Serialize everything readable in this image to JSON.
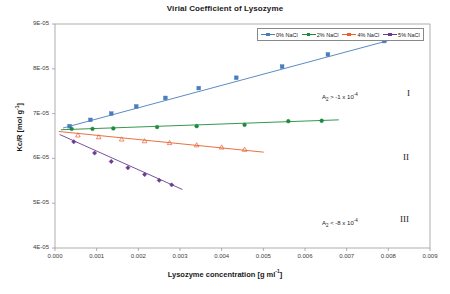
{
  "chart_data": {
    "type": "scatter",
    "title": "Virial Coefficient of Lysozyme",
    "xlabel": "Lysozyme concentration [g ml-1]",
    "xlabel_parts": {
      "text": "Lysozyme concentration [g ml",
      "sup": "-1",
      "tail": "]"
    },
    "ylabel": "Kc/R [mol g-1]",
    "ylabel_parts": {
      "text": "Kc/R [mol g",
      "sup": "-1",
      "tail": "]"
    },
    "xlim": [
      0.0,
      0.009
    ],
    "ylim": [
      4e-05,
      9e-05
    ],
    "grid": false,
    "legend_position": "top-right-inside",
    "xticks": [
      "0.000",
      "0.001",
      "0.002",
      "0.003",
      "0.004",
      "0.005",
      "0.006",
      "0.007",
      "0.008",
      "0.009"
    ],
    "xtick_values": [
      0.0,
      0.001,
      0.002,
      0.003,
      0.004,
      0.005,
      0.006,
      0.007,
      0.008,
      0.009
    ],
    "yticks": [
      "4E-05",
      "5E-05",
      "6E-05",
      "7E-05",
      "8E-05",
      "9E-05"
    ],
    "ytick_values": [
      4e-05,
      5e-05,
      6e-05,
      7e-05,
      8e-05,
      9e-05
    ],
    "series": [
      {
        "name": "0% NaCl",
        "color": "#4A7EBB",
        "marker": "square",
        "x": [
          0.00035,
          0.00085,
          0.00135,
          0.00195,
          0.00265,
          0.00345,
          0.00435,
          0.00545,
          0.00655,
          0.0079
        ],
        "y": [
          6.72e-05,
          6.86e-05,
          7e-05,
          7.16e-05,
          7.35e-05,
          7.57e-05,
          7.8e-05,
          8.05e-05,
          8.32e-05,
          8.62e-05
        ],
        "trend": {
          "x0": 0.0002,
          "y0": 6.68e-05,
          "x1": 0.0086,
          "y1": 8.78e-05
        }
      },
      {
        "name": "2% NaCl",
        "color": "#1E8B3C",
        "marker": "circle",
        "x": [
          0.0004,
          0.0009,
          0.0014,
          0.00245,
          0.0034,
          0.00455,
          0.0056,
          0.0064
        ],
        "y": [
          6.66e-05,
          6.66e-05,
          6.67e-05,
          6.7e-05,
          6.72e-05,
          6.75e-05,
          6.83e-05,
          6.84e-05
        ],
        "trend": {
          "x0": 0.00015,
          "y0": 6.64e-05,
          "x1": 0.0068,
          "y1": 6.86e-05
        }
      },
      {
        "name": "4% NaCl",
        "color": "#E8602C",
        "marker": "triangle",
        "x": [
          0.00055,
          0.00105,
          0.0016,
          0.00215,
          0.00275,
          0.0034,
          0.004,
          0.00455
        ],
        "y": [
          6.52e-05,
          6.48e-05,
          6.43e-05,
          6.39e-05,
          6.35e-05,
          6.3e-05,
          6.25e-05,
          6.2e-05
        ],
        "trend": {
          "x0": 0.0001,
          "y0": 6.6e-05,
          "x1": 0.005,
          "y1": 6.14e-05
        }
      },
      {
        "name": "5% NaCl",
        "color": "#6A3D8F",
        "marker": "diamond",
        "x": [
          0.00045,
          0.00095,
          0.00135,
          0.00175,
          0.00215,
          0.0025,
          0.0028
        ],
        "y": [
          6.37e-05,
          6.12e-05,
          5.93e-05,
          5.79e-05,
          5.64e-05,
          5.51e-05,
          5.41e-05
        ],
        "trend": {
          "x0": 0.00012,
          "y0": 6.53e-05,
          "x1": 0.00305,
          "y1": 5.31e-05
        }
      }
    ],
    "annotations": [
      {
        "id": "a2-upper",
        "text": "A2 > -1 x 10-4",
        "text_parts": {
          "pre": "A",
          "sub": "2",
          "mid": " > -1 x 10",
          "sup": "-4"
        },
        "x_px": 322,
        "y_px": 92
      },
      {
        "id": "a2-lower",
        "text": "A2 < -8 x 10-4",
        "text_parts": {
          "pre": "A",
          "sub": "2",
          "mid": " < -8 x 10",
          "sup": "-4"
        },
        "x_px": 322,
        "y_px": 218
      },
      {
        "id": "region-I",
        "text": "I",
        "x_px": 407,
        "y_px": 88
      },
      {
        "id": "region-II",
        "text": "II",
        "x_px": 403,
        "y_px": 152
      },
      {
        "id": "region-III",
        "text": "III",
        "x_px": 400,
        "y_px": 214
      }
    ]
  },
  "legend": {
    "items": [
      {
        "label": "0% NaCl",
        "color": "#4A7EBB"
      },
      {
        "label": "2% NaCl",
        "color": "#1E8B3C"
      },
      {
        "label": "4% NaCl",
        "color": "#E8602C"
      },
      {
        "label": "5% NaCl",
        "color": "#6A3D8F"
      }
    ]
  },
  "axes": {
    "frame_color": "#9a9a9a",
    "plot_left_px": 55,
    "plot_right_px": 430,
    "plot_top_px": 24,
    "plot_bottom_px": 248
  }
}
